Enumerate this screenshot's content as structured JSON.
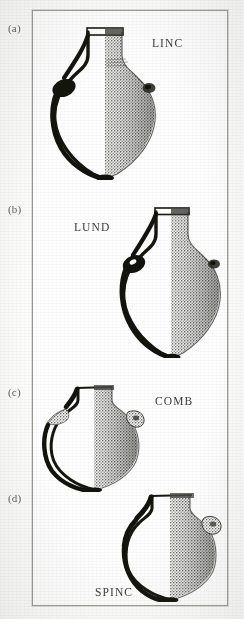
{
  "figure": {
    "kind": "archaeological-vessel-plate",
    "background_color": "#ffffff",
    "frame_color": "#9a9a94",
    "ink_color": "#1a1a18",
    "stipple_color": "#6f6f6a",
    "panel_count": 4
  },
  "panels": [
    {
      "letter": "(a)",
      "site_code": "LINC",
      "letter_pos": {
        "x": 8,
        "y": 28
      },
      "code_pos": {
        "x": 152,
        "y": 44
      },
      "vessel": {
        "name": "globular-amphora-linc",
        "pos": {
          "x": 48,
          "y": 24
        },
        "size": {
          "w": 112,
          "h": 152
        },
        "has_handle": true,
        "has_lug": true,
        "rim_type": "flared-collar"
      }
    },
    {
      "letter": "(b)",
      "site_code": "LUND",
      "letter_pos": {
        "x": 8,
        "y": 209
      },
      "code_pos": {
        "x": 74,
        "y": 228
      },
      "vessel": {
        "name": "globular-amphora-lund",
        "pos": {
          "x": 120,
          "y": 204
        },
        "size": {
          "w": 104,
          "h": 152
        },
        "has_handle": true,
        "has_lug": true,
        "rim_type": "flared-collar"
      }
    },
    {
      "letter": "(c)",
      "site_code": "COMB",
      "letter_pos": {
        "x": 8,
        "y": 392
      },
      "code_pos": {
        "x": 155,
        "y": 401
      },
      "vessel": {
        "name": "globular-jar-comb",
        "pos": {
          "x": 44,
          "y": 382
        },
        "size": {
          "w": 100,
          "h": 108
        },
        "has_handle": true,
        "has_lug": true,
        "rim_type": "short-neck"
      }
    },
    {
      "letter": "(d)",
      "site_code": "SPINC",
      "letter_pos": {
        "x": 8,
        "y": 498
      },
      "code_pos": {
        "x": 96,
        "y": 592
      },
      "vessel": {
        "name": "globular-jar-spinc",
        "pos": {
          "x": 118,
          "y": 488
        },
        "size": {
          "w": 104,
          "h": 112
        },
        "has_handle": true,
        "has_lug": true,
        "rim_type": "short-neck"
      }
    }
  ]
}
